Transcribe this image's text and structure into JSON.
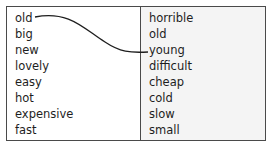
{
  "left_column": {
    "words": [
      "old",
      "big",
      "new",
      "lovely",
      "easy",
      "hot",
      "expensive",
      "fast"
    ]
  },
  "right_column": {
    "words": [
      "horrible",
      "old",
      "young",
      "difficult",
      "cheap",
      "cold",
      "slow",
      "small"
    ]
  },
  "connection": {
    "from": "old",
    "to": "young",
    "color": "#1e1e1e"
  }
}
